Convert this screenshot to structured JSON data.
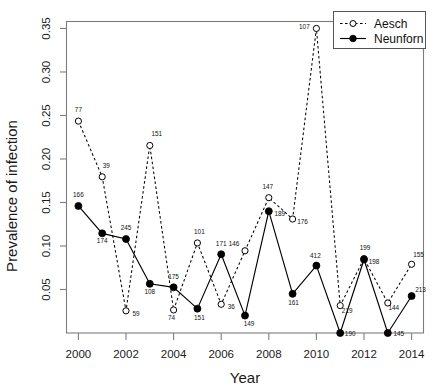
{
  "chart_data": {
    "type": "line",
    "title": "",
    "xlabel": "Year",
    "ylabel": "Prevalence of infection",
    "xlim": [
      1999.5,
      2014.5
    ],
    "ylim": [
      0.0,
      0.358
    ],
    "grid": false,
    "legend_position": "top-right",
    "xticks": [
      "2000",
      "2002",
      "2004",
      "2006",
      "2008",
      "2010",
      "2012",
      "2014"
    ],
    "xtick_values": [
      2000,
      2002,
      2004,
      2006,
      2008,
      2010,
      2012,
      2014
    ],
    "yticks": [
      "0.05",
      "0.10",
      "0.15",
      "0.20",
      "0.25",
      "0.30",
      "0.35"
    ],
    "ytick_values": [
      0.05,
      0.1,
      0.15,
      0.2,
      0.25,
      0.3,
      0.35
    ],
    "x": [
      2000,
      2001,
      2002,
      2003,
      2004,
      2005,
      2006,
      2007,
      2008,
      2009,
      2010,
      2011,
      2012,
      2013,
      2014
    ],
    "series": [
      {
        "name": "Aesch",
        "marker": "open-circle",
        "linestyle": "dashed",
        "color": "#000000",
        "values": [
          0.2435,
          0.1795,
          0.0255,
          0.2155,
          0.0265,
          0.1035,
          0.033,
          0.0945,
          0.1555,
          0.131,
          0.35,
          0.0315,
          0.0855,
          0.0345,
          0.079
        ],
        "point_labels": [
          "77",
          "39",
          "59",
          "151",
          "74",
          "101",
          "36",
          "146",
          "147",
          "176",
          "107",
          "219",
          "199",
          "144",
          "155"
        ]
      },
      {
        "name": "Neunforn",
        "marker": "filled-circle",
        "linestyle": "solid",
        "color": "#000000",
        "values": [
          0.146,
          0.1145,
          0.108,
          0.0565,
          0.0525,
          0.028,
          0.0905,
          0.02,
          0.14,
          0.045,
          0.0775,
          0.0,
          0.0845,
          0.0,
          0.0425
        ],
        "point_labels": [
          "166",
          "174",
          "245",
          "108",
          "175",
          "151",
          "171",
          "149",
          "189",
          "161",
          "412",
          "190",
          "198",
          "145",
          "213"
        ]
      }
    ]
  },
  "legend": {
    "entries": [
      {
        "label": "Aesch"
      },
      {
        "label": "Neunforn"
      }
    ]
  }
}
